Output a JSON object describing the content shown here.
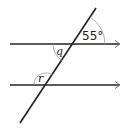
{
  "diagram": {
    "type": "parallel-lines-transversal",
    "line_color": "#222222",
    "arc_color": "#9a9a9a",
    "arrow_color": "#777777",
    "labels": {
      "given_angle": "55°",
      "angle_q": "q",
      "angle_r": "r"
    },
    "geometry": {
      "top_line": {
        "x1": 10,
        "y1": 44,
        "x2": 120,
        "y2": 44
      },
      "bottom_line": {
        "x1": 10,
        "y1": 85,
        "x2": 120,
        "y2": 85
      },
      "transversal": {
        "x1": 96,
        "y1": 8,
        "x2": 20,
        "y2": 123
      },
      "top_intersection": {
        "x": 73,
        "y": 44
      },
      "bottom_intersection": {
        "x": 46,
        "y": 85
      }
    }
  }
}
